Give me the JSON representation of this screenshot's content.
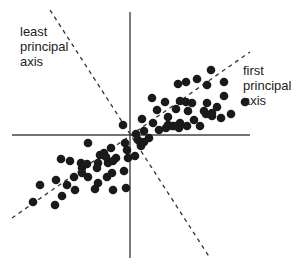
{
  "diagram": {
    "labels": {
      "least_axis": "least\nprincipal\naxis",
      "first_axis": "first\nprincipal\naxis"
    },
    "colors": {
      "ink": "#1a1a1a",
      "axis": "#444444",
      "dash": "#333333",
      "background": "#ffffff"
    },
    "axes": {
      "horizontal": {
        "x1": 12,
        "y1": 135,
        "x2": 250,
        "y2": 135
      },
      "vertical": {
        "x1": 130,
        "y1": 12,
        "x2": 130,
        "y2": 258
      }
    },
    "principal_axes": {
      "first": {
        "x1": 12,
        "y1": 218,
        "x2": 250,
        "y2": 52
      },
      "least": {
        "x1": 50,
        "y1": 10,
        "x2": 210,
        "y2": 258
      }
    },
    "points": [
      [
        178,
        84
      ],
      [
        186,
        82
      ],
      [
        197,
        79
      ],
      [
        211,
        70
      ],
      [
        207,
        85
      ],
      [
        224,
        82
      ],
      [
        224,
        96
      ],
      [
        180,
        101
      ],
      [
        192,
        103
      ],
      [
        207,
        103
      ],
      [
        206,
        114
      ],
      [
        212,
        113
      ],
      [
        217,
        107
      ],
      [
        221,
        118
      ],
      [
        231,
        114
      ],
      [
        245,
        102
      ],
      [
        152,
        98
      ],
      [
        165,
        102
      ],
      [
        176,
        109
      ],
      [
        157,
        110
      ],
      [
        168,
        117
      ],
      [
        186,
        102
      ],
      [
        188,
        111
      ],
      [
        180,
        123
      ],
      [
        194,
        120
      ],
      [
        200,
        126
      ],
      [
        187,
        126
      ],
      [
        204,
        111
      ],
      [
        179,
        128
      ],
      [
        212,
        116
      ],
      [
        123,
        125
      ],
      [
        142,
        119
      ],
      [
        144,
        131
      ],
      [
        136,
        134
      ],
      [
        153,
        123
      ],
      [
        159,
        130
      ],
      [
        166,
        128
      ],
      [
        174,
        126
      ],
      [
        144,
        142
      ],
      [
        168,
        125
      ],
      [
        172,
        126
      ],
      [
        125,
        143
      ],
      [
        149,
        138
      ],
      [
        111,
        148
      ],
      [
        138,
        140
      ],
      [
        100,
        155
      ],
      [
        104,
        153
      ],
      [
        116,
        158
      ],
      [
        127,
        150
      ],
      [
        113,
        161
      ],
      [
        141,
        146
      ],
      [
        135,
        156
      ],
      [
        128,
        158
      ],
      [
        88,
        143
      ],
      [
        61,
        159
      ],
      [
        70,
        161
      ],
      [
        81,
        163
      ],
      [
        98,
        163
      ],
      [
        108,
        163
      ],
      [
        106,
        157
      ],
      [
        87,
        164
      ],
      [
        97,
        168
      ],
      [
        82,
        168
      ],
      [
        74,
        177
      ],
      [
        88,
        177
      ],
      [
        107,
        177
      ],
      [
        112,
        173
      ],
      [
        124,
        171
      ],
      [
        98,
        183
      ],
      [
        75,
        190
      ],
      [
        56,
        180
      ],
      [
        40,
        185
      ],
      [
        62,
        196
      ],
      [
        55,
        205
      ],
      [
        33,
        202
      ],
      [
        126,
        188
      ],
      [
        113,
        190
      ],
      [
        95,
        189
      ],
      [
        82,
        173
      ],
      [
        67,
        185
      ]
    ]
  }
}
